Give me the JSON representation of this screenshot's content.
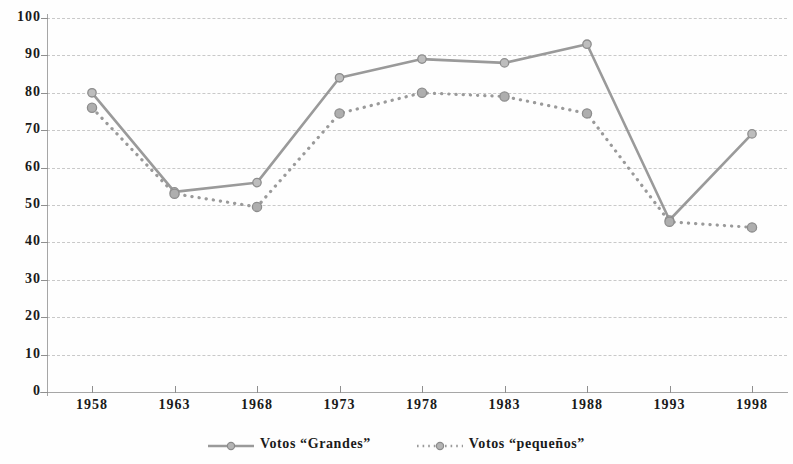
{
  "chart_data": {
    "type": "line",
    "title": "",
    "subtitle": "",
    "xlabel": "",
    "ylabel": "",
    "categories": [
      "1958",
      "1963",
      "1968",
      "1973",
      "1978",
      "1983",
      "1988",
      "1993",
      "1998"
    ],
    "series": [
      {
        "name": "Votos “Grandes”",
        "values": [
          80,
          53.5,
          56,
          84,
          89,
          88,
          93,
          46,
          69
        ],
        "style": "solid",
        "color": "#9a9a9a",
        "marker": "circle"
      },
      {
        "name": "Votos “pequeños”",
        "values": [
          76,
          53,
          49.5,
          74.5,
          80,
          79,
          74.5,
          45.5,
          44
        ],
        "style": "dotted",
        "color": "#9a9a9a",
        "marker": "circle"
      }
    ],
    "ylim": [
      0,
      100
    ],
    "ytick_labels": [
      "0",
      "10",
      "20",
      "30",
      "40",
      "50",
      "60",
      "70",
      "80",
      "90",
      "100"
    ],
    "ytick_values": [
      0,
      10,
      20,
      30,
      40,
      50,
      60,
      70,
      80,
      90,
      100
    ],
    "grid": "horizontal-dashed",
    "legend_position": "bottom-center",
    "background_color": "#ffffff",
    "axis_color": "#a6a6a6",
    "grid_color": "#c9c9c9",
    "text_color": "#1a1a1a"
  },
  "legend": {
    "items": [
      {
        "label": "Votos “Grandes”",
        "marker_icon": "line-solid-circle-marker-icon"
      },
      {
        "label": "Votos “pequeños”",
        "marker_icon": "line-dotted-circle-marker-icon"
      }
    ]
  }
}
